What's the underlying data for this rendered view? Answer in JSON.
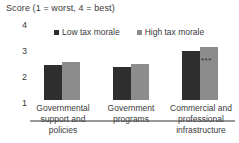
{
  "chart_data": {
    "type": "bar",
    "title": "Score (1 = worst, 4 = best)",
    "xlabel": "",
    "ylabel": "Score",
    "ylim": [
      1,
      4
    ],
    "yticks": [
      "4",
      "3",
      "2",
      "1"
    ],
    "grid": false,
    "legend_position": "top-center",
    "categories": [
      "Governmental support and policies",
      "Government programs",
      "Commercial and professional infrastructure"
    ],
    "category_lines": [
      [
        "Governmental",
        "support and",
        "policies"
      ],
      [
        "Government",
        "programs"
      ],
      [
        "Commercial and",
        "professional",
        "infrastructure"
      ]
    ],
    "series": [
      {
        "name": "Low tax morale",
        "color": "#2e2e2e",
        "values": [
          2.35,
          2.26,
          2.9
        ]
      },
      {
        "name": "High tax morale",
        "color": "#8c8c8c",
        "values": [
          2.45,
          2.38,
          3.02
        ]
      }
    ],
    "annotations": [
      {
        "text": "***",
        "category_index": 2,
        "series_index": 1
      }
    ]
  },
  "legend": {
    "items": [
      {
        "label": "Low tax morale",
        "swatch": "#2e2e2e"
      },
      {
        "label": "High tax morale",
        "swatch": "#8c8c8c"
      }
    ]
  },
  "yaxis": {
    "t4": "4",
    "t3": "3",
    "t2": "2",
    "t1": "1"
  },
  "caption": "Score (1 = worst, 4 = best)",
  "categories": {
    "g1l1": "Governmental",
    "g1l2": "support and",
    "g1l3": "policies",
    "g2l1": "Government",
    "g2l2": "programs",
    "g3l1": "Commercial and",
    "g3l2": "professional",
    "g3l3": "infrastructure"
  },
  "significance": {
    "group3": "***"
  }
}
